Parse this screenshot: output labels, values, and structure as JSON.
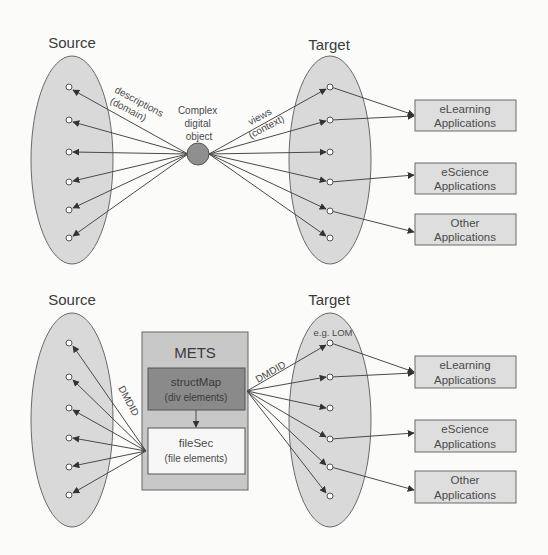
{
  "top_panel": {
    "source_label": "Source",
    "target_label": "Target",
    "center_label_lines": [
      "Complex",
      "digital",
      "object"
    ],
    "left_edge_label_lines": [
      "descriptions",
      "(domain)"
    ],
    "right_edge_label_lines": [
      "views",
      "(context)"
    ],
    "applications": [
      {
        "line1": "eLearning",
        "line2": "Applications"
      },
      {
        "line1": "eScience",
        "line2": "Applications"
      },
      {
        "line1": "Other",
        "line2": "Applications"
      }
    ]
  },
  "bottom_panel": {
    "source_label": "Source",
    "target_label": "Target",
    "mets_title": "METS",
    "struct_map": {
      "line1": "structMap",
      "line2": "(div elements)"
    },
    "file_sec": {
      "line1": "fileSec",
      "line2": "(file elements)"
    },
    "left_edge_label": "DMDID",
    "right_edge_label": "DMDID",
    "target_annotation": "e.g. LOM",
    "applications": [
      {
        "line1": "eLearning",
        "line2": "Applications"
      },
      {
        "line1": "eScience",
        "line2": "Applications"
      },
      {
        "line1": "Other",
        "line2": "Applications"
      }
    ]
  },
  "colors": {
    "ellipse_fill": "#d9d9d9",
    "center_node_fill": "#8f8f8f",
    "mets_fill": "#c8c8c8",
    "struct_map_fill": "#8a8a8a",
    "file_sec_fill": "#f7f7f7",
    "app_box_fill": "#dedede",
    "line_color": "#4a4a4a"
  }
}
